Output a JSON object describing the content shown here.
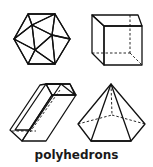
{
  "figure": {
    "caption": "polyhedrons",
    "shapes": [
      {
        "name": "icosahedron"
      },
      {
        "name": "cube"
      },
      {
        "name": "rectangular-prism"
      },
      {
        "name": "pentagonal-pyramid"
      }
    ],
    "colors": {
      "face_light": "#e4e4e4",
      "face_mid": "#c9c9c9",
      "face_dark": "#a9a9a9",
      "edge": "#111111"
    }
  }
}
